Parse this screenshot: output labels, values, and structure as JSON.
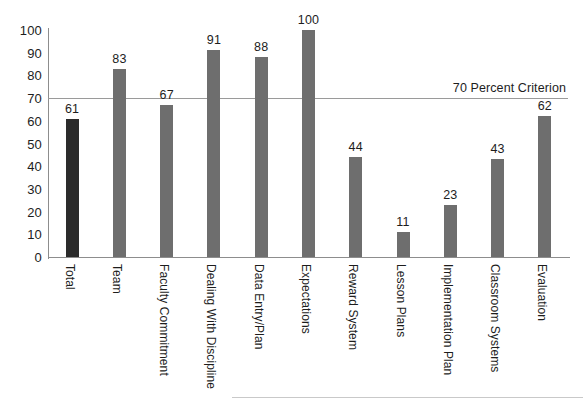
{
  "chart_data": {
    "type": "bar",
    "title": "",
    "xlabel": "",
    "ylabel": "",
    "ylim": [
      0,
      100
    ],
    "yticks": [
      0,
      10,
      20,
      30,
      40,
      50,
      60,
      70,
      80,
      90,
      100
    ],
    "grid": false,
    "legend": "none",
    "categories": [
      "Total",
      "Team",
      "Faculty Commitment",
      "Dealing With Discipline",
      "Data Entry/Plan",
      "Expectations",
      "Reward System",
      "Lesson Plans",
      "Implementation Plan",
      "Classroom Systems",
      "Evaluation"
    ],
    "values": [
      61,
      83,
      67,
      91,
      88,
      100,
      44,
      11,
      23,
      43,
      62
    ],
    "bar_colors": [
      "#2b2b2b",
      "#6e6e6e",
      "#6e6e6e",
      "#6e6e6e",
      "#6e6e6e",
      "#6e6e6e",
      "#6e6e6e",
      "#6e6e6e",
      "#6e6e6e",
      "#6e6e6e",
      "#6e6e6e"
    ],
    "annotations": [
      {
        "name": "criterion-line",
        "label": "70 Percent Criterion",
        "value": 70,
        "orientation": "horizontal",
        "color": "#9a9a9a"
      }
    ],
    "axis_color": "#8d8d8d",
    "text_color": "#1d1d1d",
    "background": "#ffffff"
  }
}
